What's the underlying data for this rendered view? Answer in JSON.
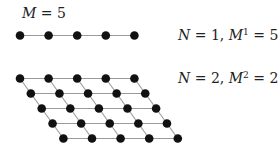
{
  "labels": {
    "top_left": {
      "var": "M",
      "rest": " = 5"
    },
    "row1": {
      "n_var": "N",
      "n_rest": " = 1, ",
      "m_var": "M",
      "m_exp": "1",
      "m_rest": " = 5"
    },
    "row2": {
      "n_var": "N",
      "n_rest": " = 2, ",
      "m_var": "M",
      "m_exp": "2",
      "m_rest": " = 25"
    }
  },
  "diagram": {
    "M": 5,
    "one_d": {
      "N": 1,
      "count": 5,
      "origin": [
        20,
        35.5
      ],
      "dx": 28.6
    },
    "two_d": {
      "N": 2,
      "count": 25,
      "origin": [
        20,
        78.5
      ],
      "dx": 28.6,
      "row_shift": [
        10.85,
        15
      ]
    },
    "colors": {
      "dot": "#111111",
      "edge": "#9a9a9a",
      "text": "#222222"
    }
  }
}
